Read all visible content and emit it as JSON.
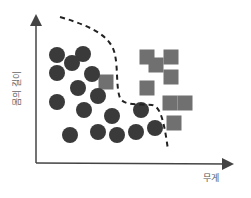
{
  "diagram": {
    "type": "classification-scatter",
    "x_axis_label": "무게",
    "y_axis_label": "몸의 길이",
    "colors": {
      "circle": "#3a3a3a",
      "square": "#707070",
      "axis": "#444444",
      "boundary": "#222222"
    },
    "circles": [
      {
        "x": 57,
        "y": 55
      },
      {
        "x": 83,
        "y": 54
      },
      {
        "x": 72,
        "y": 63
      },
      {
        "x": 57,
        "y": 73
      },
      {
        "x": 92,
        "y": 74
      },
      {
        "x": 78,
        "y": 88
      },
      {
        "x": 57,
        "y": 102
      },
      {
        "x": 84,
        "y": 110
      },
      {
        "x": 98,
        "y": 96
      },
      {
        "x": 112,
        "y": 116
      },
      {
        "x": 70,
        "y": 135
      },
      {
        "x": 98,
        "y": 132
      },
      {
        "x": 117,
        "y": 135
      },
      {
        "x": 136,
        "y": 132
      },
      {
        "x": 155,
        "y": 128
      },
      {
        "x": 141,
        "y": 110
      }
    ],
    "squares": [
      {
        "x": 147,
        "y": 57
      },
      {
        "x": 171,
        "y": 57
      },
      {
        "x": 156,
        "y": 65
      },
      {
        "x": 171,
        "y": 77
      },
      {
        "x": 147,
        "y": 88
      },
      {
        "x": 170,
        "y": 103
      },
      {
        "x": 185,
        "y": 103
      },
      {
        "x": 174,
        "y": 123
      },
      {
        "x": 106,
        "y": 82
      }
    ],
    "square_size": 15,
    "circle_radius": 8,
    "boundary_path": "M60,17 C95,27 112,38 115,55 C118,68 116,88 120,98 C124,106 140,104 152,105 C160,106 164,120 168,150"
  }
}
